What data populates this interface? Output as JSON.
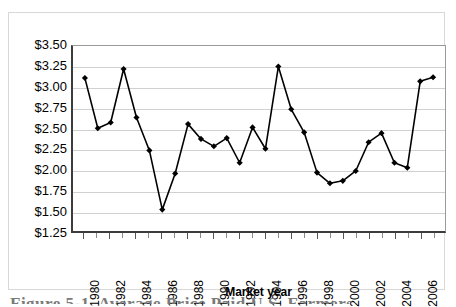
{
  "chart_data": {
    "type": "line",
    "title": "",
    "xlabel": "Market year",
    "ylabel": "",
    "ylim": [
      1.25,
      3.5
    ],
    "ytick_step": 0.25,
    "ytick_labels": [
      "$3.50",
      "$3.25",
      "$3.00",
      "$2.75",
      "$2.50",
      "$2.25",
      "$2.00",
      "$1.75",
      "$1.50",
      "$1.25"
    ],
    "ytick_values": [
      3.5,
      3.25,
      3.0,
      2.75,
      2.5,
      2.25,
      2.0,
      1.75,
      1.5,
      1.25
    ],
    "grid": true,
    "legend": "none",
    "marker": "diamond",
    "line_color": "#000000",
    "marker_color": "#000000",
    "x": [
      1980,
      1981,
      1982,
      1983,
      1984,
      1985,
      1986,
      1987,
      1988,
      1989,
      1990,
      1991,
      1992,
      1993,
      1994,
      1995,
      1996,
      1997,
      1998,
      1999,
      2000,
      2001,
      2002,
      2003,
      2004,
      2005,
      2006,
      2007
    ],
    "xtick_labels": [
      "1980",
      "1982",
      "1984",
      "1986",
      "1988",
      "1990",
      "1992",
      "1994",
      "1996",
      "1998",
      "2000",
      "2002",
      "2004",
      "2006"
    ],
    "xtick_values": [
      1980,
      1982,
      1984,
      1986,
      1988,
      1990,
      1992,
      1994,
      1996,
      1998,
      2000,
      2002,
      2004,
      2006
    ],
    "values": [
      3.11,
      2.5,
      2.57,
      3.22,
      2.63,
      2.23,
      1.51,
      1.95,
      2.55,
      2.37,
      2.28,
      2.38,
      2.08,
      2.51,
      2.25,
      3.25,
      2.73,
      2.45,
      1.96,
      1.83,
      1.86,
      1.98,
      2.33,
      2.44,
      2.08,
      2.02,
      3.07,
      3.12
    ]
  },
  "axis": {
    "x_title": "Market year"
  },
  "caption": {
    "text": "Figure 5-1. Average Price Paid U.S. Farmers"
  }
}
